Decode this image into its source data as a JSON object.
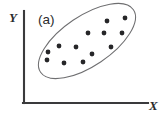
{
  "figure": {
    "panel_label": "(a)",
    "background_color": "#ffffff"
  },
  "axes": {
    "x_label": "X",
    "y_label": "Y",
    "axis_color": "#3a3a3c",
    "origin": {
      "x": 24,
      "y": 103
    },
    "x_axis_end": {
      "x": 148,
      "y": 103
    },
    "y_axis_top": {
      "x": 24,
      "y": 11
    }
  },
  "chart_data": {
    "type": "scatter",
    "title": "(a)",
    "xlabel": "X",
    "ylabel": "Y",
    "grid": false,
    "legend": null,
    "point_color": "#262628",
    "point_radius": 2.4,
    "xlim": [
      24,
      148
    ],
    "ylim": [
      11,
      103
    ],
    "points": [
      {
        "x": 125,
        "y": 18
      },
      {
        "x": 107,
        "y": 21
      },
      {
        "x": 122,
        "y": 33
      },
      {
        "x": 104,
        "y": 33
      },
      {
        "x": 88,
        "y": 33
      },
      {
        "x": 111,
        "y": 47
      },
      {
        "x": 92,
        "y": 54
      },
      {
        "x": 76,
        "y": 47
      },
      {
        "x": 59,
        "y": 46
      },
      {
        "x": 48,
        "y": 52
      },
      {
        "x": 83,
        "y": 62
      },
      {
        "x": 64,
        "y": 63
      },
      {
        "x": 47,
        "y": 60
      }
    ],
    "annotations": [
      {
        "kind": "ellipse",
        "label": "data-cluster-ellipse",
        "center_x": 87,
        "center_y": 41,
        "radius_x": 56,
        "radius_y": 25,
        "rotation_deg": -34,
        "stroke": "#6e6e70",
        "fill": "none"
      }
    ]
  }
}
